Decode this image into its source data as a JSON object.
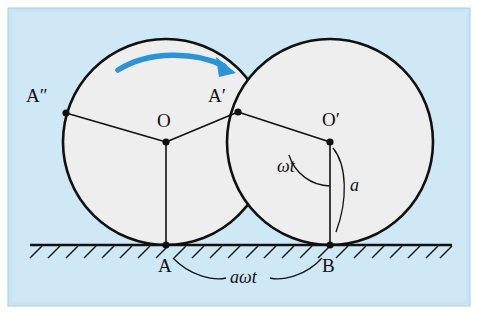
{
  "figure": {
    "background_color": "#cfe8f5",
    "border_color": "#9ec9de",
    "frame": {
      "x": 8,
      "y": 8,
      "width": 462,
      "height": 298
    },
    "panel": {
      "x": 14,
      "y": 13,
      "width": 450,
      "height": 288
    },
    "circle_fill": "#efefef",
    "circle_stroke": "#111111",
    "arrow_color": "#2a94d6",
    "ground_color": "#111111"
  },
  "circles": [
    {
      "name": "left-circle",
      "cx": 166,
      "cy": 142,
      "r": 103
    },
    {
      "name": "right-circle",
      "cx": 330,
      "cy": 142,
      "r": 103
    }
  ],
  "ground": {
    "y": 245,
    "x_start": 30,
    "x_end": 452,
    "hatch_count": 23
  },
  "arc_arrow": {
    "name": "rotation-direction-arrow",
    "from_x": 118,
    "from_y": 69,
    "to_x": 232,
    "to_y": 72
  },
  "points": [
    {
      "name": "point-O",
      "x": 166,
      "y": 142
    },
    {
      "name": "point-O-prime",
      "x": 330,
      "y": 142
    },
    {
      "name": "point-A",
      "x": 166,
      "y": 245
    },
    {
      "name": "point-B",
      "x": 330,
      "y": 245
    },
    {
      "name": "point-A-prime",
      "x": 238,
      "y": 112
    },
    {
      "name": "point-A-double-prime",
      "x": 66,
      "y": 113
    }
  ],
  "labels": [
    {
      "name": "label-A-double-prime",
      "text": "A″",
      "x": 26,
      "y": 86,
      "size": "big"
    },
    {
      "name": "label-A-prime",
      "text": "A′",
      "x": 208,
      "y": 86,
      "size": "big"
    },
    {
      "name": "label-O",
      "text": "O",
      "x": 157,
      "y": 111,
      "size": "big"
    },
    {
      "name": "label-O-prime",
      "text": "O′",
      "x": 322,
      "y": 110,
      "size": "big"
    },
    {
      "name": "label-A",
      "text": "A",
      "x": 158,
      "y": 256,
      "size": "big"
    },
    {
      "name": "label-B",
      "text": "B",
      "x": 322,
      "y": 256,
      "size": "big"
    },
    {
      "name": "label-omega-t",
      "text": "ωt",
      "x": 277,
      "y": 157,
      "size": "mid"
    },
    {
      "name": "label-a",
      "text": "a",
      "x": 350,
      "y": 176,
      "size": "mid"
    },
    {
      "name": "label-a-omega-t",
      "text": "aωt",
      "x": 230,
      "y": 268,
      "size": "mid"
    }
  ]
}
